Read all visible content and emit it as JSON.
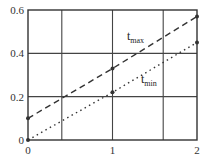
{
  "chart_data": {
    "type": "line",
    "title": "",
    "xlabel": "",
    "ylabel": "",
    "xlim": [
      0,
      2
    ],
    "ylim": [
      0,
      0.6
    ],
    "x_ticks": [
      0,
      1,
      2
    ],
    "x_tick_labels": [
      "0",
      "1",
      "2"
    ],
    "y_ticks": [
      0,
      0.2,
      0.4,
      0.6
    ],
    "y_tick_labels": [
      "0",
      "0.2",
      "0.4",
      "0.6"
    ],
    "grid": true,
    "vertical_gridlines_observed_at": [
      0.4,
      1.0,
      1.6
    ],
    "horizontal_gridlines_at": [
      0.2,
      0.4
    ],
    "legend": "inline labels on lines",
    "series": [
      {
        "name": "t_max",
        "label_main": "t",
        "label_sub": "max",
        "line_style": "dashed",
        "x": [
          0,
          1,
          2
        ],
        "values": [
          0.1,
          0.33,
          0.57
        ]
      },
      {
        "name": "t_min",
        "label_main": "t",
        "label_sub": "min",
        "line_style": "dotted",
        "x": [
          0,
          1,
          2
        ],
        "values": [
          0.0,
          0.22,
          0.45
        ]
      }
    ]
  }
}
